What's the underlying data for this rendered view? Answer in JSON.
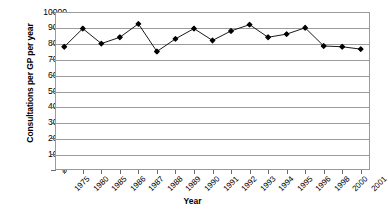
{
  "chart_data": {
    "type": "line",
    "title": "",
    "xlabel": "Year",
    "ylabel": "Consultations per GP per year",
    "categories": [
      "1975",
      "1980",
      "1985",
      "1986",
      "1987",
      "1988",
      "1989",
      "1990",
      "1991",
      "1992",
      "1993",
      "1994",
      "1995",
      "1996",
      "1998",
      "2000",
      "2001"
    ],
    "values": [
      7800,
      8950,
      8000,
      8400,
      9250,
      7500,
      8300,
      8950,
      8200,
      8800,
      9200,
      8400,
      8600,
      9000,
      7850,
      7800,
      7650
    ],
    "series": [
      {
        "name": "Consultations per GP per year",
        "values": [
          7800,
          8950,
          8000,
          8400,
          9250,
          7500,
          8300,
          8950,
          8200,
          8800,
          9200,
          8400,
          8600,
          9000,
          7850,
          7800,
          7650
        ]
      }
    ],
    "ylim": [
      0,
      10000
    ],
    "ytick_labels": [
      "10000",
      "9000",
      "8000",
      "7000",
      "6000",
      "5000",
      "4000",
      "3000",
      "2000",
      "1000",
      "0"
    ],
    "ytick_values": [
      10000,
      9000,
      8000,
      7000,
      6000,
      5000,
      4000,
      3000,
      2000,
      1000,
      0
    ],
    "grid": true,
    "grid_color": "#9a9a9a",
    "legend": false,
    "legend_position": "none",
    "line_color": "#000000",
    "marker": "filled-diamond",
    "marker_color": "#000000",
    "plot_background": "#ffffff"
  },
  "axes": {
    "y_title": "Consultations per GP per year",
    "x_title": "Year"
  }
}
